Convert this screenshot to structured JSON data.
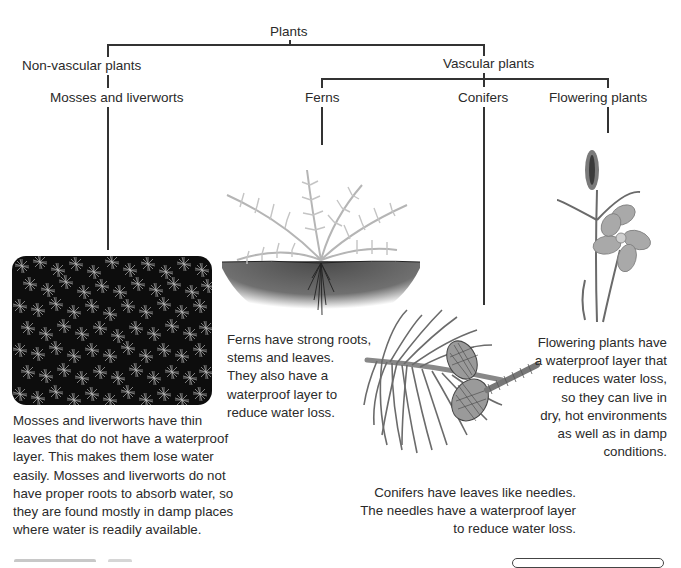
{
  "tree": {
    "root": "Plants",
    "non_vascular": {
      "label": "Non-vascular plants",
      "children": [
        "Mosses and liverworts"
      ]
    },
    "vascular": {
      "label": "Vascular plants",
      "children": [
        "Ferns",
        "Conifers",
        "Flowering plants"
      ]
    }
  },
  "groups": [
    {
      "name": "Mosses and liverworts",
      "image": "moss-photo",
      "description": "Mosses and liverworts have thin leaves that do not have a waterproof layer. This makes them lose water easily. Mosses and liverworts do not have proper roots to absorb water, so they are found mostly in damp places where water is readily available.",
      "lines": [
        "Mosses and liverworts have thin",
        "leaves that do not have a waterproof",
        "layer. This makes them lose water",
        "easily. Mosses and liverworts do not",
        "have proper roots to absorb water, so",
        "they are found mostly in damp places",
        "where water is readily available."
      ]
    },
    {
      "name": "Ferns",
      "image": "fern-illustration",
      "description": "Ferns have strong roots, stems and leaves. They also have a waterproof layer to reduce water loss.",
      "lines": [
        "Ferns have strong roots,",
        "stems and leaves.",
        "They also have a",
        "waterproof layer to",
        "reduce water loss."
      ]
    },
    {
      "name": "Conifers",
      "image": "conifer-branch-illustration",
      "description": "Conifers have leaves like needles. The needles have a waterproof layer to reduce water loss.",
      "lines": [
        "Conifers have leaves like needles.",
        "The needles have a waterproof layer",
        "to reduce water loss."
      ]
    },
    {
      "name": "Flowering plants",
      "image": "flower-illustration",
      "description": "Flowering plants have a waterproof layer that reduces water loss, so they can live in dry, hot environments as well as in damp conditions.",
      "lines": [
        "Flowering plants have",
        "a waterproof layer that",
        "reduces water loss,",
        "so they can live in",
        "dry, hot environments",
        "as well as in damp",
        "conditions."
      ]
    }
  ],
  "colors": {
    "line": "#333333",
    "text": "#2a2a2a",
    "moss_bg": "#111111",
    "soil": "#555555",
    "fern": "#b8b8b8"
  }
}
